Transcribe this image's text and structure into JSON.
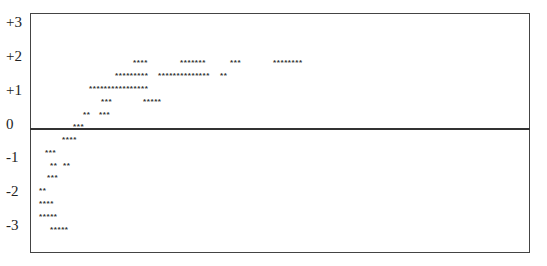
{
  "chart_data": {
    "type": "scatter",
    "title": "",
    "xlabel": "",
    "ylabel": "",
    "ylim": [
      -3.8,
      3.3
    ],
    "y_ticks": [
      "+3",
      "+2",
      "+1",
      "0",
      "-1",
      "-2",
      "-3"
    ],
    "grid": false,
    "legend": null,
    "marker": "*",
    "zero_line": true,
    "rows": [
      {
        "y": 1.8,
        "groups": [
          {
            "x": 133,
            "count": 4
          },
          {
            "x": 180,
            "count": 7
          },
          {
            "x": 230,
            "count": 3
          },
          {
            "x": 273,
            "count": 8
          }
        ]
      },
      {
        "y": 1.45,
        "groups": [
          {
            "x": 115,
            "count": 9
          },
          {
            "x": 158,
            "count": 14
          },
          {
            "x": 220,
            "count": 2
          }
        ]
      },
      {
        "y": 1.05,
        "groups": [
          {
            "x": 89,
            "count": 16
          }
        ]
      },
      {
        "y": 0.7,
        "groups": [
          {
            "x": 101,
            "count": 3
          },
          {
            "x": 143,
            "count": 5
          }
        ]
      },
      {
        "y": 0.3,
        "groups": [
          {
            "x": 83,
            "count": 2
          },
          {
            "x": 99,
            "count": 3
          }
        ]
      },
      {
        "y": -0.05,
        "groups": [
          {
            "x": 73,
            "count": 3
          }
        ]
      },
      {
        "y": -0.4,
        "groups": [
          {
            "x": 62,
            "count": 4
          }
        ]
      },
      {
        "y": -0.8,
        "groups": [
          {
            "x": 45,
            "count": 3
          }
        ]
      },
      {
        "y": -1.2,
        "groups": [
          {
            "x": 50,
            "count": 2
          },
          {
            "x": 63,
            "count": 2
          }
        ]
      },
      {
        "y": -1.55,
        "groups": [
          {
            "x": 47,
            "count": 3
          }
        ]
      },
      {
        "y": -1.95,
        "groups": [
          {
            "x": 39,
            "count": 2
          }
        ]
      },
      {
        "y": -2.35,
        "groups": [
          {
            "x": 39,
            "count": 4
          }
        ]
      },
      {
        "y": -2.7,
        "groups": [
          {
            "x": 39,
            "count": 5
          }
        ]
      },
      {
        "y": -3.1,
        "groups": [
          {
            "x": 50,
            "count": 5
          }
        ]
      }
    ]
  },
  "axis": {
    "labels": [
      {
        "text": "+3",
        "top": 15
      },
      {
        "text": "+2",
        "top": 49
      },
      {
        "text": "+1",
        "top": 83
      },
      {
        "text": "0",
        "top": 117
      },
      {
        "text": "-1",
        "top": 150
      },
      {
        "text": "-2",
        "top": 184
      },
      {
        "text": "-3",
        "top": 218
      }
    ]
  },
  "rows_px": [
    {
      "top": 59,
      "groups": [
        {
          "left": 133,
          "text": "****"
        },
        {
          "left": 180,
          "text": "*******"
        },
        {
          "left": 230,
          "text": "***"
        },
        {
          "left": 273,
          "text": "********"
        }
      ]
    },
    {
      "top": 72,
      "groups": [
        {
          "left": 115,
          "text": "*********"
        },
        {
          "left": 158,
          "text": "**************"
        },
        {
          "left": 220,
          "text": "**"
        }
      ]
    },
    {
      "top": 85,
      "groups": [
        {
          "left": 89,
          "text": "****************"
        }
      ]
    },
    {
      "top": 98,
      "groups": [
        {
          "left": 101,
          "text": "***"
        },
        {
          "left": 143,
          "text": "*****"
        }
      ]
    },
    {
      "top": 111,
      "groups": [
        {
          "left": 83,
          "text": "**"
        },
        {
          "left": 99,
          "text": "***"
        }
      ]
    },
    {
      "top": 123,
      "groups": [
        {
          "left": 73,
          "text": "***"
        }
      ]
    },
    {
      "top": 136,
      "groups": [
        {
          "left": 62,
          "text": "****"
        }
      ]
    },
    {
      "top": 149,
      "groups": [
        {
          "left": 45,
          "text": "***"
        }
      ]
    },
    {
      "top": 162,
      "groups": [
        {
          "left": 50,
          "text": "**"
        },
        {
          "left": 63,
          "text": "**"
        }
      ]
    },
    {
      "top": 174,
      "groups": [
        {
          "left": 47,
          "text": "***"
        }
      ]
    },
    {
      "top": 187,
      "groups": [
        {
          "left": 39,
          "text": "**"
        }
      ]
    },
    {
      "top": 200,
      "groups": [
        {
          "left": 39,
          "text": "****"
        }
      ]
    },
    {
      "top": 213,
      "groups": [
        {
          "left": 39,
          "text": "*****"
        }
      ]
    },
    {
      "top": 226,
      "groups": [
        {
          "left": 50,
          "text": "*****"
        }
      ]
    }
  ]
}
